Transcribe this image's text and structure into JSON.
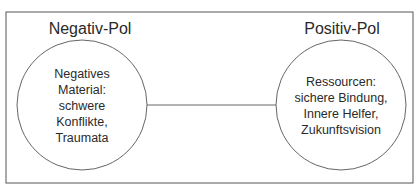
{
  "diagram": {
    "left_pole": {
      "title": "Negativ-Pol",
      "lines": [
        "Negatives",
        "Material:",
        "schwere",
        "Konflikte,",
        "Traumata"
      ]
    },
    "right_pole": {
      "title": "Positiv-Pol",
      "lines": [
        "Ressourcen:",
        "sichere Bindung,",
        "Innere Helfer,",
        "Zukunftsvision"
      ]
    },
    "colors": {
      "stroke": "#555555",
      "text": "#2a2a2a",
      "background": "#ffffff"
    }
  }
}
